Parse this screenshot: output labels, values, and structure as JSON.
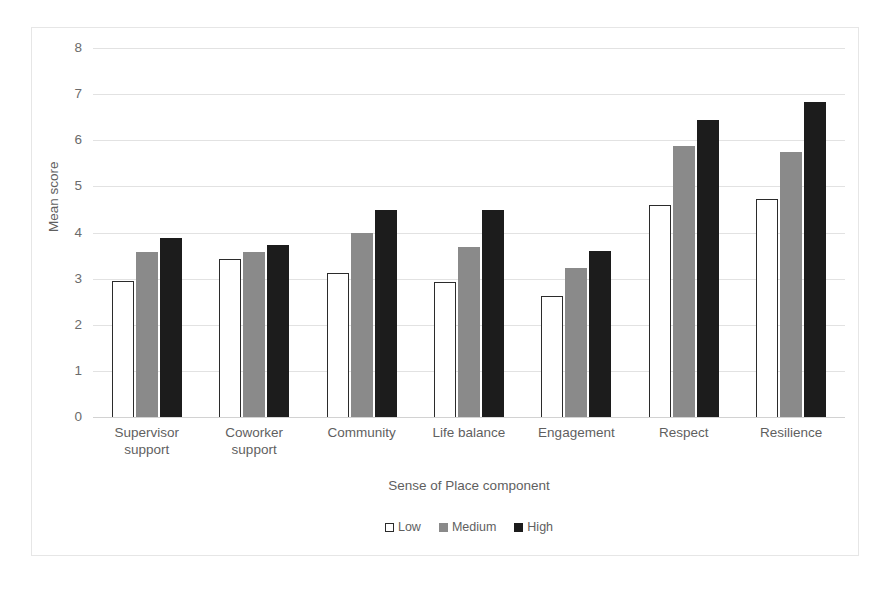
{
  "chart_data": {
    "type": "bar",
    "title": "",
    "subtitle": "",
    "xlabel": "Sense of Place component",
    "ylabel": "Mean score",
    "ylim": [
      0,
      8
    ],
    "ytick_step": 1,
    "yticks": [
      "8",
      "7",
      "6",
      "5",
      "4",
      "3",
      "2",
      "1",
      "0"
    ],
    "grid": true,
    "legend_position": "bottom",
    "categories": [
      "Supervisor support",
      "Coworker support",
      "Community",
      "Life balance",
      "Engagement",
      "Respect",
      "Resilience"
    ],
    "category_lines": [
      [
        "Supervisor",
        "support"
      ],
      [
        "Coworker",
        "support"
      ],
      [
        "Community",
        ""
      ],
      [
        "Life balance",
        ""
      ],
      [
        "Engagement",
        ""
      ],
      [
        "Respect",
        ""
      ],
      [
        "Resilience",
        ""
      ]
    ],
    "series": [
      {
        "name": "Low",
        "color": "#ffffff",
        "edge_color": "#2b2b2b",
        "values": [
          2.95,
          3.42,
          3.13,
          2.93,
          2.63,
          4.6,
          4.72
        ]
      },
      {
        "name": "Medium",
        "color": "#8a8a8a",
        "edge_color": "#8a8a8a",
        "values": [
          3.57,
          3.58,
          4.0,
          3.68,
          3.22,
          5.88,
          5.75
        ]
      },
      {
        "name": "High",
        "color": "#1c1c1c",
        "edge_color": "#1c1c1c",
        "values": [
          3.89,
          3.72,
          4.48,
          4.49,
          3.6,
          6.43,
          6.82
        ]
      }
    ]
  },
  "legend": {
    "items": [
      {
        "label": "Low",
        "style": "low"
      },
      {
        "label": "Medium",
        "style": "medium"
      },
      {
        "label": "High",
        "style": "high"
      }
    ]
  }
}
